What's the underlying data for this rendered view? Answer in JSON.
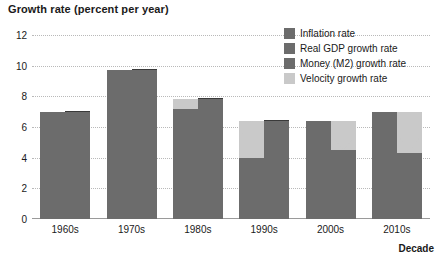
{
  "chart_data": {
    "type": "bar",
    "title": "Growth rate (percent per year)",
    "xlabel": "Decade",
    "ylabel": "Growth rate (percent per year)",
    "ylim": [
      0,
      12
    ],
    "yticks": [
      0,
      2,
      4,
      6,
      8,
      10,
      12
    ],
    "grid": true,
    "legend_position": "top-right",
    "categories": [
      "1960s",
      "1970s",
      "1980s",
      "1990s",
      "2000s",
      "2010s"
    ],
    "series": [
      {
        "name": "Money (M2) growth rate",
        "values": [
          7.0,
          9.7,
          7.2,
          4.0,
          6.4,
          7.0
        ]
      },
      {
        "name": "Velocity growth rate",
        "values": [
          0.0,
          0.0,
          0.6,
          2.4,
          -1.9,
          -2.7
        ]
      },
      {
        "name": "Inflation rate",
        "values": [
          4.4,
          3.2,
          3.0,
          3.1,
          2.2,
          2.0
        ]
      },
      {
        "name": "Real GDP growth rate",
        "values": [
          2.6,
          6.5,
          4.8,
          3.3,
          2.3,
          2.3
        ]
      }
    ],
    "bars": [
      {
        "category": "1960s",
        "left_bar": {
          "money": 7.0,
          "velocity": 0.0,
          "total": 7.0,
          "arrow": "none"
        },
        "right_bar": {
          "inflation": 4.4,
          "gdp_top": 7.0,
          "velocity_top": 7.0,
          "total": 7.0
        }
      },
      {
        "category": "1970s",
        "left_bar": {
          "money": 9.7,
          "velocity": 0.0,
          "total": 9.7,
          "arrow": "none"
        },
        "right_bar": {
          "inflation": 3.2,
          "gdp_top": 9.7,
          "velocity_top": 9.7,
          "total": 9.7
        }
      },
      {
        "category": "1980s",
        "left_bar": {
          "money": 7.2,
          "velocity": 0.6,
          "total": 7.8,
          "arrow": "none"
        },
        "right_bar": {
          "inflation": 3.0,
          "gdp_top": 7.8,
          "velocity_top": 7.8,
          "total": 7.8
        }
      },
      {
        "category": "1990s",
        "left_bar": {
          "money": 4.0,
          "velocity": 2.4,
          "total": 6.4,
          "arrow": "up"
        },
        "right_bar": {
          "inflation": 3.1,
          "gdp_top": 6.4,
          "velocity_top": 6.4,
          "total": 6.4
        }
      },
      {
        "category": "2000s",
        "left_bar": {
          "money": 6.4,
          "velocity": 0.0,
          "total": 6.4,
          "arrow": "none"
        },
        "right_bar": {
          "inflation": 2.2,
          "gdp_top": 4.5,
          "velocity_top": 6.4,
          "total": 6.4,
          "arrow": "down"
        }
      },
      {
        "category": "2010s",
        "left_bar": {
          "money": 7.0,
          "velocity": 0.0,
          "total": 7.0,
          "arrow": "none"
        },
        "right_bar": {
          "inflation": 2.0,
          "gdp_top": 4.3,
          "velocity_top": 7.0,
          "total": 7.0,
          "arrow": "down"
        }
      }
    ],
    "legend": [
      {
        "label": "Inflation rate",
        "color": "#6c6c6c"
      },
      {
        "label": "Real GDP growth rate",
        "color": "#6c6c6c"
      },
      {
        "label": "Money (M2) growth rate",
        "color": "#6c6c6c"
      },
      {
        "label": "Velocity growth rate",
        "color": "#c9c9c9"
      }
    ],
    "colors": {
      "bar_dark": "#6c6c6c",
      "bar_light": "#c9c9c9",
      "divider": "#3a3a3a",
      "grid": "#b9b9b9",
      "axis": "#9a9a9a",
      "text": "#1a1a1a",
      "background": "#ffffff"
    }
  }
}
